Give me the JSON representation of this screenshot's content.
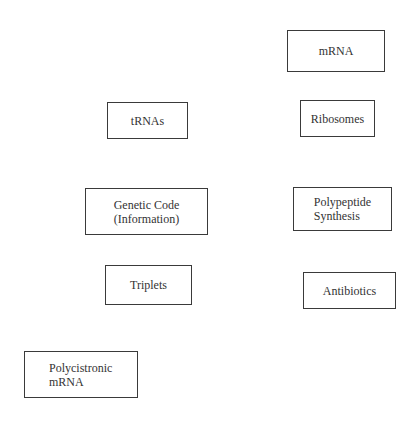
{
  "diagram": {
    "boxes": [
      {
        "id": "mrna",
        "label": "mRNA"
      },
      {
        "id": "ribosomes",
        "label": "Ribosomes"
      },
      {
        "id": "trnas",
        "label": "tRNAs"
      },
      {
        "id": "genetic_code",
        "label": "Genetic Code\n(Information)"
      },
      {
        "id": "polypeptide_synthesis",
        "label": "Polypeptide\nSynthesis"
      },
      {
        "id": "triplets",
        "label": "Triplets"
      },
      {
        "id": "antibiotics",
        "label": "Antibiotics"
      },
      {
        "id": "polycistronic_mrna",
        "label": "Polycistronic\nmRNA"
      }
    ]
  }
}
